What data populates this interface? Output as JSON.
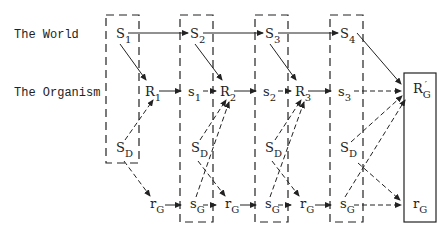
{
  "rows": {
    "world": "The World",
    "organism": "The Organism"
  },
  "nodes": {
    "S1": {
      "main": "S",
      "sub": "1"
    },
    "S2": {
      "main": "S",
      "sub": "2"
    },
    "S3": {
      "main": "S",
      "sub": "3"
    },
    "S4": {
      "main": "S",
      "sub": "4"
    },
    "R1": {
      "main": "R",
      "sub": "1"
    },
    "s1": {
      "main": "s",
      "sub": "1"
    },
    "R2": {
      "main": "R",
      "sub": "2"
    },
    "s2": {
      "main": "s",
      "sub": "2"
    },
    "R3": {
      "main": "R",
      "sub": "3"
    },
    "s3": {
      "main": "s",
      "sub": "3"
    },
    "RG_prime": {
      "main": "R",
      "sub": "G",
      "prime": "′"
    },
    "SD1": {
      "main": "S",
      "sub": "D"
    },
    "SD2": {
      "main": "S",
      "sub": "D"
    },
    "SD3": {
      "main": "S",
      "sub": "D"
    },
    "SD4": {
      "main": "S",
      "sub": "D"
    },
    "rG1": {
      "main": "r",
      "sub": "G"
    },
    "sG1": {
      "main": "s",
      "sub": "G"
    },
    "rG2": {
      "main": "r",
      "sub": "G"
    },
    "sG2": {
      "main": "s",
      "sub": "G"
    },
    "rG3": {
      "main": "r",
      "sub": "G"
    },
    "sG3": {
      "main": "s",
      "sub": "G"
    },
    "rG_goal": {
      "main": "r",
      "sub": "G"
    }
  },
  "colors": {
    "ink": "#222222",
    "background": "#ffffff"
  }
}
